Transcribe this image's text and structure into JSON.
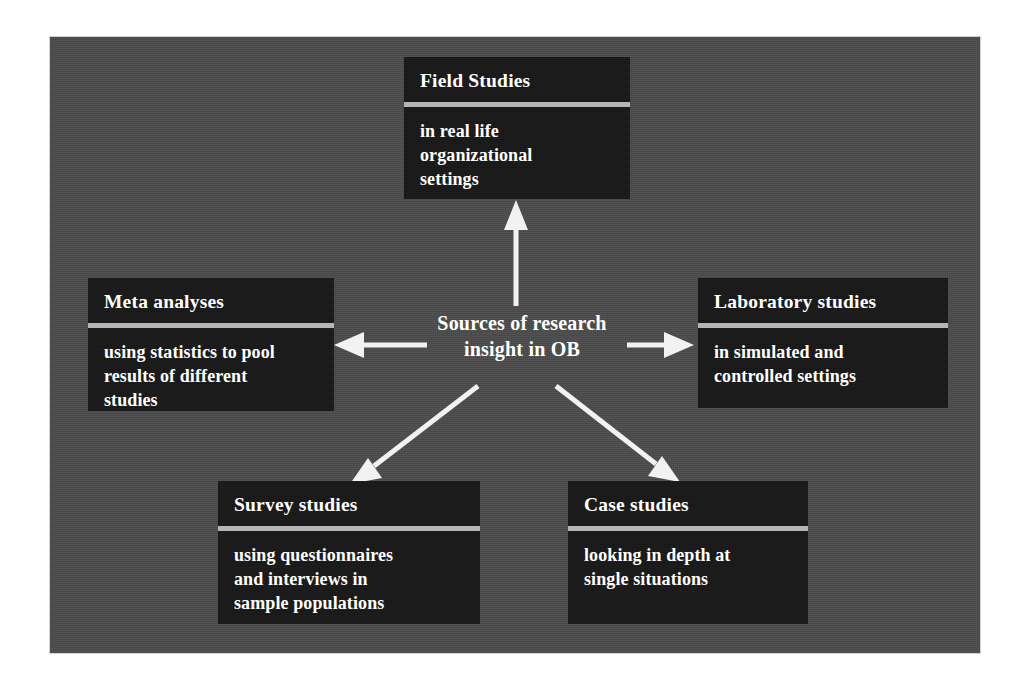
{
  "diagram": {
    "center": {
      "label": "Sources of research\ninsight in OB"
    },
    "nodes": [
      {
        "id": "field",
        "title": "Field Studies",
        "body": "in real life\norganizational\nsettings"
      },
      {
        "id": "meta",
        "title": "Meta analyses",
        "body": "using statistics to pool\nresults of different\nstudies"
      },
      {
        "id": "laboratory",
        "title": "Laboratory studies",
        "body": "in simulated and\ncontrolled settings"
      },
      {
        "id": "survey",
        "title": "Survey studies",
        "body": "using questionnaires\nand interviews in\nsample populations"
      },
      {
        "id": "case",
        "title": "Case studies",
        "body": "looking in depth at\nsingle situations"
      }
    ],
    "arrows": [
      {
        "id": "arrow-to-field",
        "direction": "up"
      },
      {
        "id": "arrow-to-meta",
        "direction": "left"
      },
      {
        "id": "arrow-to-laboratory",
        "direction": "right"
      },
      {
        "id": "arrow-to-survey",
        "direction": "down-left"
      },
      {
        "id": "arrow-to-case",
        "direction": "down-right"
      }
    ],
    "colors": {
      "panel_background": "#4b4b4b",
      "node_fill": "#191919",
      "node_rule": "#b5b5b5",
      "text": "#ffffff",
      "arrow": "#f2f2f2",
      "page_background": "#ffffff"
    }
  }
}
